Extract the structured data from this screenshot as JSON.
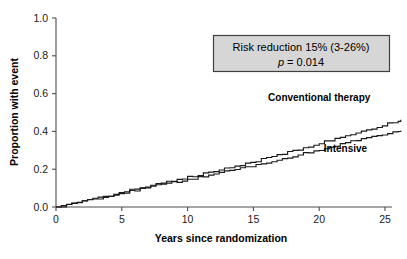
{
  "chart_data": {
    "type": "line",
    "title": "",
    "xlabel": "Years since randomization",
    "ylabel": "Proportion with event",
    "xlim": [
      0,
      26.5
    ],
    "ylim": [
      0.0,
      1.0
    ],
    "xticks": [
      0,
      5,
      10,
      15,
      20,
      25
    ],
    "xtick_labels": [
      "0",
      "5",
      "10",
      "15",
      "20",
      "25"
    ],
    "yticks": [
      0.0,
      0.2,
      0.4,
      0.6,
      0.8,
      1.0
    ],
    "ytick_labels": [
      "0.0",
      "0.2",
      "0.4",
      "0.6",
      "0.8",
      "1.0"
    ],
    "grid": false,
    "legend_position": "inline-at-curve-ends",
    "series": [
      {
        "name": "Conventional therapy",
        "label_x": 20.0,
        "label_y": 0.56,
        "color": "#1a1a1a",
        "x": [
          0,
          0.4,
          0.8,
          1.2,
          1.6,
          2.0,
          2.4,
          2.8,
          3.2,
          3.6,
          4.0,
          4.4,
          4.8,
          5.2,
          5.6,
          6.0,
          6.4,
          6.8,
          7.2,
          7.6,
          8.0,
          8.4,
          8.8,
          9.2,
          9.6,
          10.0,
          10.4,
          10.8,
          11.2,
          11.6,
          12.0,
          12.4,
          12.8,
          13.2,
          13.6,
          14.0,
          14.4,
          14.8,
          15.2,
          15.6,
          16.0,
          16.4,
          16.8,
          17.2,
          17.6,
          18.0,
          18.4,
          18.8,
          19.2,
          19.6,
          20.0,
          20.4,
          20.8,
          21.2,
          21.6,
          22.0,
          22.4,
          22.8,
          23.2,
          23.6,
          24.0,
          24.4,
          24.8,
          25.2,
          25.6,
          26.0,
          26.2
        ],
        "y": [
          0.0,
          0.005,
          0.011,
          0.017,
          0.023,
          0.029,
          0.035,
          0.041,
          0.048,
          0.055,
          0.062,
          0.069,
          0.076,
          0.083,
          0.09,
          0.097,
          0.104,
          0.111,
          0.117,
          0.122,
          0.127,
          0.133,
          0.139,
          0.145,
          0.151,
          0.157,
          0.163,
          0.169,
          0.175,
          0.181,
          0.187,
          0.194,
          0.201,
          0.208,
          0.215,
          0.222,
          0.229,
          0.236,
          0.243,
          0.251,
          0.259,
          0.267,
          0.275,
          0.283,
          0.291,
          0.299,
          0.307,
          0.315,
          0.323,
          0.331,
          0.339,
          0.347,
          0.355,
          0.363,
          0.371,
          0.379,
          0.387,
          0.394,
          0.401,
          0.408,
          0.415,
          0.423,
          0.432,
          0.441,
          0.45,
          0.458,
          0.462
        ]
      },
      {
        "name": "Intensive",
        "label_x": 22.0,
        "label_y": 0.29,
        "color": "#1a1a1a",
        "x": [
          0,
          0.4,
          0.8,
          1.2,
          1.6,
          2.0,
          2.4,
          2.8,
          3.2,
          3.6,
          4.0,
          4.4,
          4.8,
          5.2,
          5.6,
          6.0,
          6.4,
          6.8,
          7.2,
          7.6,
          8.0,
          8.4,
          8.8,
          9.2,
          9.6,
          10.0,
          10.4,
          10.8,
          11.2,
          11.6,
          12.0,
          12.4,
          12.8,
          13.2,
          13.6,
          14.0,
          14.4,
          14.8,
          15.2,
          15.6,
          16.0,
          16.4,
          16.8,
          17.2,
          17.6,
          18.0,
          18.4,
          18.8,
          19.2,
          19.6,
          20.0,
          20.4,
          20.8,
          21.2,
          21.6,
          22.0,
          22.4,
          22.8,
          23.2,
          23.6,
          24.0,
          24.4,
          24.8,
          25.2,
          25.6,
          26.0,
          26.2
        ],
        "y": [
          0.0,
          0.005,
          0.011,
          0.017,
          0.023,
          0.029,
          0.035,
          0.041,
          0.047,
          0.053,
          0.059,
          0.065,
          0.071,
          0.077,
          0.083,
          0.089,
          0.095,
          0.101,
          0.107,
          0.113,
          0.119,
          0.125,
          0.131,
          0.136,
          0.141,
          0.146,
          0.151,
          0.156,
          0.162,
          0.168,
          0.174,
          0.18,
          0.186,
          0.192,
          0.198,
          0.204,
          0.21,
          0.216,
          0.222,
          0.228,
          0.234,
          0.241,
          0.248,
          0.255,
          0.262,
          0.269,
          0.276,
          0.283,
          0.29,
          0.297,
          0.304,
          0.311,
          0.318,
          0.325,
          0.332,
          0.339,
          0.346,
          0.352,
          0.358,
          0.364,
          0.37,
          0.376,
          0.382,
          0.389,
          0.396,
          0.401,
          0.404
        ]
      }
    ],
    "annotations": [
      {
        "id": "risk-reduction-box",
        "line1": "Risk reduction 15% (3-26%)",
        "line2_italic": "p",
        "line2_rest": " = 0.014",
        "box_fill": "#d6d6d6",
        "box_border": "#404040"
      }
    ]
  },
  "axes": {
    "x_title": "Years since randomization",
    "y_title": "Proportion with event"
  },
  "colors": {
    "curve": "#1a1a1a",
    "axis": "#4d4d4d",
    "box_fill": "#d6d6d6",
    "box_border": "#404040",
    "background": "#ffffff"
  }
}
